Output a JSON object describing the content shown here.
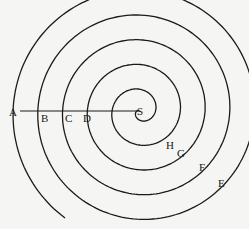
{
  "diagram": {
    "type": "archimedean-spiral",
    "center_label": "S",
    "radius_line_from": "A",
    "radius_line_to": "S",
    "stroke_color": "#1a1a1a",
    "background_color": "#f5f5f3",
    "labels": [
      {
        "id": "A",
        "text": "A",
        "x": 9,
        "y": 107
      },
      {
        "id": "B",
        "text": "B",
        "x": 41,
        "y": 113
      },
      {
        "id": "C",
        "text": "C",
        "x": 65,
        "y": 113
      },
      {
        "id": "D",
        "text": "D",
        "x": 83,
        "y": 113
      },
      {
        "id": "S",
        "text": "S",
        "x": 137,
        "y": 106
      },
      {
        "id": "H",
        "text": "H",
        "x": 166,
        "y": 140
      },
      {
        "id": "G",
        "text": "G",
        "x": 177,
        "y": 148
      },
      {
        "id": "F",
        "text": "F",
        "x": 199,
        "y": 162
      },
      {
        "id": "E",
        "text": "E",
        "x": 218,
        "y": 178
      }
    ],
    "geometry": {
      "center": [
        140,
        111
      ],
      "line_start": [
        20,
        111
      ],
      "line_end": [
        140,
        111
      ],
      "outer_radius": 121,
      "turns": 5.2,
      "start_angle_deg": 235
    }
  }
}
